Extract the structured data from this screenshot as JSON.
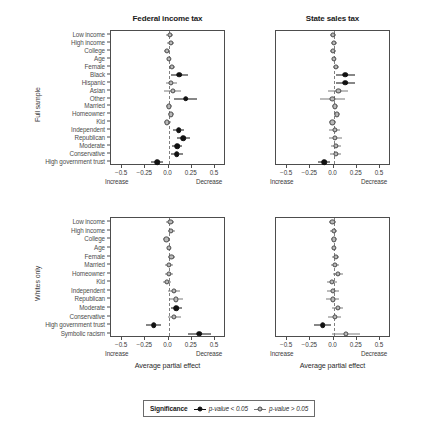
{
  "figure": {
    "width": 445,
    "height": 434,
    "colors": {
      "significant": "#111111",
      "not_significant": "#b8b8b8",
      "marker_edge": "#4a4a4a",
      "axis": "#4d4d4d",
      "zero_line": "#808080",
      "background": "#ffffff"
    }
  },
  "legend": {
    "title": "Significance",
    "entries": [
      {
        "label": "p-value < 0.05",
        "style": "sig"
      },
      {
        "label": "p-value > 0.05",
        "style": "ns"
      }
    ]
  },
  "axis": {
    "title": "Average partial effect",
    "ticks": [
      {
        "value": -0.5,
        "label": "−0.5"
      },
      {
        "value": -0.25,
        "label": "−0.25"
      },
      {
        "value": 0.0,
        "label": "0.0"
      },
      {
        "value": 0.25,
        "label": "0.25"
      },
      {
        "value": 0.5,
        "label": "0.5"
      }
    ],
    "xlim": [
      -0.62,
      0.62
    ],
    "left_direction_label": "Increase",
    "right_direction_label": "Decrease"
  },
  "column_titles": [
    "Federal income tax",
    "State sales tax"
  ],
  "row_labels": [
    "Full sample",
    "Whites only"
  ],
  "chart_data": {
    "type": "scatter",
    "subtype": "coefficient-plot-forest",
    "title": "",
    "xlabel": "Average partial effect",
    "ylabel": "",
    "xlim": [
      -0.62,
      0.62
    ],
    "xticks": [
      -0.5,
      -0.25,
      0.0,
      0.25,
      0.5
    ],
    "grid": false,
    "zero_reference_line": 0.0,
    "legend_position": "bottom-center",
    "panels": [
      {
        "row": "Full sample",
        "column": "Federal income tax",
        "categories": [
          "Low income",
          "High income",
          "College",
          "Age",
          "Female",
          "Black",
          "Hispanic",
          "Asian",
          "Other",
          "Married",
          "Homeowner",
          "Kid",
          "Independent",
          "Republican",
          "Moderate",
          "Conservative",
          "High government trust"
        ],
        "points": [
          {
            "label": "Low income",
            "estimate": 0.012,
            "ci_low": -0.022,
            "ci_high": 0.047,
            "significant": false
          },
          {
            "label": "High income",
            "estimate": 0.022,
            "ci_low": -0.011,
            "ci_high": 0.058,
            "significant": false
          },
          {
            "label": "College",
            "estimate": -0.018,
            "ci_low": -0.048,
            "ci_high": 0.013,
            "significant": false
          },
          {
            "label": "Age",
            "estimate": 0.008,
            "ci_low": -0.012,
            "ci_high": 0.028,
            "significant": false
          },
          {
            "label": "Female",
            "estimate": 0.038,
            "ci_low": 0.005,
            "ci_high": 0.071,
            "significant": false
          },
          {
            "label": "Black",
            "estimate": 0.118,
            "ci_low": 0.03,
            "ci_high": 0.208,
            "significant": true
          },
          {
            "label": "Hispanic",
            "estimate": 0.03,
            "ci_low": -0.032,
            "ci_high": 0.092,
            "significant": false
          },
          {
            "label": "Asian",
            "estimate": 0.046,
            "ci_low": -0.045,
            "ci_high": 0.138,
            "significant": false
          },
          {
            "label": "Other",
            "estimate": 0.185,
            "ci_low": 0.06,
            "ci_high": 0.312,
            "significant": true
          },
          {
            "label": "Married",
            "estimate": 0.002,
            "ci_low": -0.032,
            "ci_high": 0.036,
            "significant": false
          },
          {
            "label": "Homeowner",
            "estimate": 0.028,
            "ci_low": -0.008,
            "ci_high": 0.064,
            "significant": false
          },
          {
            "label": "Kid",
            "estimate": -0.015,
            "ci_low": -0.052,
            "ci_high": 0.022,
            "significant": false
          },
          {
            "label": "Independent",
            "estimate": 0.11,
            "ci_low": 0.052,
            "ci_high": 0.17,
            "significant": true
          },
          {
            "label": "Republican",
            "estimate": 0.158,
            "ci_low": 0.092,
            "ci_high": 0.228,
            "significant": true
          },
          {
            "label": "Moderate",
            "estimate": 0.092,
            "ci_low": 0.04,
            "ci_high": 0.146,
            "significant": true
          },
          {
            "label": "Conservative",
            "estimate": 0.09,
            "ci_low": 0.028,
            "ci_high": 0.155,
            "significant": true
          },
          {
            "label": "High government trust",
            "estimate": -0.122,
            "ci_low": -0.188,
            "ci_high": -0.058,
            "significant": true
          }
        ]
      },
      {
        "row": "Full sample",
        "column": "State sales tax",
        "categories": [
          "Low income",
          "High income",
          "College",
          "Age",
          "Female",
          "Black",
          "Hispanic",
          "Asian",
          "Other",
          "Married",
          "Homeowner",
          "Kid",
          "Independent",
          "Republican",
          "Moderate",
          "Conservative",
          "High government trust"
        ],
        "points": [
          {
            "label": "Low income",
            "estimate": -0.008,
            "ci_low": -0.04,
            "ci_high": 0.026,
            "significant": false
          },
          {
            "label": "High income",
            "estimate": 0.003,
            "ci_low": -0.032,
            "ci_high": 0.04,
            "significant": false
          },
          {
            "label": "College",
            "estimate": -0.01,
            "ci_low": -0.042,
            "ci_high": 0.022,
            "significant": false
          },
          {
            "label": "Age",
            "estimate": 0.004,
            "ci_low": -0.016,
            "ci_high": 0.024,
            "significant": false
          },
          {
            "label": "Female",
            "estimate": 0.03,
            "ci_low": -0.002,
            "ci_high": 0.062,
            "significant": false
          },
          {
            "label": "Black",
            "estimate": 0.125,
            "ci_low": 0.022,
            "ci_high": 0.232,
            "significant": true
          },
          {
            "label": "Hispanic",
            "estimate": 0.128,
            "ci_low": 0.028,
            "ci_high": 0.23,
            "significant": true
          },
          {
            "label": "Asian",
            "estimate": 0.052,
            "ci_low": -0.055,
            "ci_high": 0.16,
            "significant": false
          },
          {
            "label": "Other",
            "estimate": -0.012,
            "ci_low": -0.15,
            "ci_high": 0.125,
            "significant": false
          },
          {
            "label": "Married",
            "estimate": 0.018,
            "ci_low": -0.018,
            "ci_high": 0.052,
            "significant": false
          },
          {
            "label": "Homeowner",
            "estimate": 0.038,
            "ci_low": 0.002,
            "ci_high": 0.075,
            "significant": false
          },
          {
            "label": "Kid",
            "estimate": -0.012,
            "ci_low": -0.052,
            "ci_high": 0.026,
            "significant": false
          },
          {
            "label": "Independent",
            "estimate": 0.012,
            "ci_low": -0.048,
            "ci_high": 0.072,
            "significant": false
          },
          {
            "label": "Republican",
            "estimate": 0.018,
            "ci_low": -0.052,
            "ci_high": 0.088,
            "significant": false
          },
          {
            "label": "Moderate",
            "estimate": 0.03,
            "ci_low": -0.022,
            "ci_high": 0.082,
            "significant": false
          },
          {
            "label": "Conservative",
            "estimate": 0.022,
            "ci_low": -0.042,
            "ci_high": 0.086,
            "significant": false
          },
          {
            "label": "High government trust",
            "estimate": -0.098,
            "ci_low": -0.162,
            "ci_high": -0.034,
            "significant": true
          }
        ]
      },
      {
        "row": "Whites only",
        "column": "Federal income tax",
        "categories": [
          "Low income",
          "High income",
          "College",
          "Age",
          "Female",
          "Married",
          "Homeowner",
          "Kid",
          "Independent",
          "Republican",
          "Moderate",
          "Conservative",
          "High government trust",
          "Symbolic racism"
        ],
        "points": [
          {
            "label": "Low income",
            "estimate": 0.02,
            "ci_low": -0.022,
            "ci_high": 0.062,
            "significant": false
          },
          {
            "label": "High income",
            "estimate": 0.028,
            "ci_low": -0.01,
            "ci_high": 0.068,
            "significant": false
          },
          {
            "label": "College",
            "estimate": -0.022,
            "ci_low": -0.058,
            "ci_high": 0.014,
            "significant": false
          },
          {
            "label": "Age",
            "estimate": 0.005,
            "ci_low": -0.018,
            "ci_high": 0.028,
            "significant": false
          },
          {
            "label": "Female",
            "estimate": 0.032,
            "ci_low": -0.006,
            "ci_high": 0.07,
            "significant": false
          },
          {
            "label": "Married",
            "estimate": 0.005,
            "ci_low": -0.035,
            "ci_high": 0.045,
            "significant": false
          },
          {
            "label": "Homeowner",
            "estimate": 0.005,
            "ci_low": -0.04,
            "ci_high": 0.05,
            "significant": false
          },
          {
            "label": "Kid",
            "estimate": -0.02,
            "ci_low": -0.064,
            "ci_high": 0.024,
            "significant": false
          },
          {
            "label": "Independent",
            "estimate": 0.062,
            "ci_low": -0.002,
            "ci_high": 0.128,
            "significant": false
          },
          {
            "label": "Republican",
            "estimate": 0.08,
            "ci_low": 0.01,
            "ci_high": 0.152,
            "significant": false
          },
          {
            "label": "Moderate",
            "estimate": 0.085,
            "ci_low": 0.022,
            "ci_high": 0.148,
            "significant": true
          },
          {
            "label": "Conservative",
            "estimate": 0.062,
            "ci_low": -0.008,
            "ci_high": 0.132,
            "significant": false
          },
          {
            "label": "High government trust",
            "estimate": -0.158,
            "ci_low": -0.238,
            "ci_high": -0.08,
            "significant": true
          },
          {
            "label": "Symbolic racism",
            "estimate": 0.33,
            "ci_low": 0.205,
            "ci_high": 0.455,
            "significant": true
          }
        ]
      },
      {
        "row": "Whites only",
        "column": "State sales tax",
        "categories": [
          "Low income",
          "High income",
          "College",
          "Age",
          "Female",
          "Married",
          "Homeowner",
          "Kid",
          "Independent",
          "Republican",
          "Moderate",
          "Conservative",
          "High government trust",
          "Symbolic racism"
        ],
        "points": [
          {
            "label": "Low income",
            "estimate": -0.012,
            "ci_low": -0.052,
            "ci_high": 0.028,
            "significant": false
          },
          {
            "label": "High income",
            "estimate": 0.0,
            "ci_low": -0.04,
            "ci_high": 0.042,
            "significant": false
          },
          {
            "label": "College",
            "estimate": 0.003,
            "ci_low": -0.032,
            "ci_high": 0.04,
            "significant": false
          },
          {
            "label": "Age",
            "estimate": 0.002,
            "ci_low": -0.02,
            "ci_high": 0.024,
            "significant": false
          },
          {
            "label": "Female",
            "estimate": 0.022,
            "ci_low": -0.016,
            "ci_high": 0.06,
            "significant": false
          },
          {
            "label": "Married",
            "estimate": 0.012,
            "ci_low": -0.032,
            "ci_high": 0.056,
            "significant": false
          },
          {
            "label": "Homeowner",
            "estimate": 0.048,
            "ci_low": -0.002,
            "ci_high": 0.098,
            "significant": false
          },
          {
            "label": "Kid",
            "estimate": -0.018,
            "ci_low": -0.072,
            "ci_high": 0.036,
            "significant": false
          },
          {
            "label": "Independent",
            "estimate": -0.008,
            "ci_low": -0.07,
            "ci_high": 0.055,
            "significant": false
          },
          {
            "label": "Republican",
            "estimate": -0.01,
            "ci_low": -0.082,
            "ci_high": 0.062,
            "significant": false
          },
          {
            "label": "Moderate",
            "estimate": 0.046,
            "ci_low": -0.012,
            "ci_high": 0.105,
            "significant": false
          },
          {
            "label": "Conservative",
            "estimate": 0.012,
            "ci_low": -0.058,
            "ci_high": 0.082,
            "significant": false
          },
          {
            "label": "High government trust",
            "estimate": -0.118,
            "ci_low": -0.208,
            "ci_high": -0.028,
            "significant": true
          },
          {
            "label": "Symbolic racism",
            "estimate": 0.135,
            "ci_low": -0.02,
            "ci_high": 0.29,
            "significant": false
          }
        ]
      }
    ]
  }
}
